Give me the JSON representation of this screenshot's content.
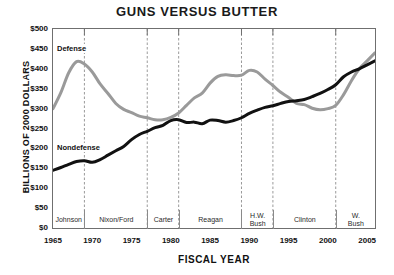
{
  "chart_data": {
    "type": "line",
    "title": "GUNS VERSUS BUTTER",
    "xlabel": "FISCAL YEAR",
    "ylabel": "BILLIONS OF 2000 DOLLARS",
    "xlim": [
      1965,
      2006
    ],
    "ylim": [
      0,
      500
    ],
    "grid": "vertical dashed lines at presidential term boundaries",
    "legend": "inline labels on curves",
    "y_ticks": [
      "$0",
      "$50",
      "$100",
      "$150",
      "$200",
      "$250",
      "$300",
      "$350",
      "$400",
      "$450",
      "$500"
    ],
    "y_tick_values": [
      0,
      50,
      100,
      150,
      200,
      250,
      300,
      350,
      400,
      450,
      500
    ],
    "x_ticks": [
      "1965",
      "1970",
      "1975",
      "1980",
      "1985",
      "1990",
      "1995",
      "2000",
      "2005"
    ],
    "x_tick_values": [
      1965,
      1970,
      1975,
      1980,
      1985,
      1990,
      1995,
      2000,
      2005
    ],
    "x": [
      1965,
      1966,
      1967,
      1968,
      1969,
      1970,
      1971,
      1972,
      1973,
      1974,
      1975,
      1976,
      1977,
      1978,
      1979,
      1980,
      1981,
      1982,
      1983,
      1984,
      1985,
      1986,
      1987,
      1988,
      1989,
      1990,
      1991,
      1992,
      1993,
      1994,
      1995,
      1996,
      1997,
      1998,
      1999,
      2000,
      2001,
      2002,
      2003,
      2004,
      2005,
      2006
    ],
    "series": [
      {
        "name": "Defense",
        "color": "#9a9a9a",
        "values": [
          300,
          340,
          390,
          418,
          412,
          392,
          362,
          338,
          313,
          298,
          290,
          281,
          277,
          272,
          272,
          278,
          289,
          308,
          327,
          339,
          364,
          381,
          385,
          383,
          384,
          396,
          392,
          374,
          358,
          341,
          328,
          313,
          310,
          301,
          297,
          300,
          308,
          335,
          370,
          400,
          420,
          440
        ]
      },
      {
        "name": "Nondefense",
        "color": "#111111",
        "values": [
          145,
          152,
          160,
          167,
          169,
          165,
          172,
          183,
          194,
          205,
          222,
          235,
          243,
          252,
          258,
          270,
          272,
          265,
          266,
          262,
          271,
          270,
          266,
          270,
          277,
          288,
          296,
          303,
          307,
          313,
          318,
          320,
          323,
          330,
          338,
          348,
          360,
          380,
          392,
          400,
          410,
          420
        ]
      }
    ],
    "annotations": [
      {
        "text": "Defense",
        "series": "Defense"
      },
      {
        "text": "Nondefense",
        "series": "Nondefense"
      }
    ],
    "presidents": [
      {
        "label": "Johnson",
        "start": 1965,
        "end": 1969
      },
      {
        "label": "Nixon/Ford",
        "start": 1969,
        "end": 1977
      },
      {
        "label": "Carter",
        "start": 1977,
        "end": 1981
      },
      {
        "label": "Reagan",
        "start": 1981,
        "end": 1989
      },
      {
        "label": "H.W.\nBush",
        "line1": "H.W.",
        "line2": "Bush",
        "start": 1989,
        "end": 1993
      },
      {
        "label": "Clinton",
        "start": 1993,
        "end": 2001
      },
      {
        "label": "W.\nBush",
        "line1": "W.",
        "line2": "Bush",
        "start": 2001,
        "end": 2006
      }
    ]
  }
}
